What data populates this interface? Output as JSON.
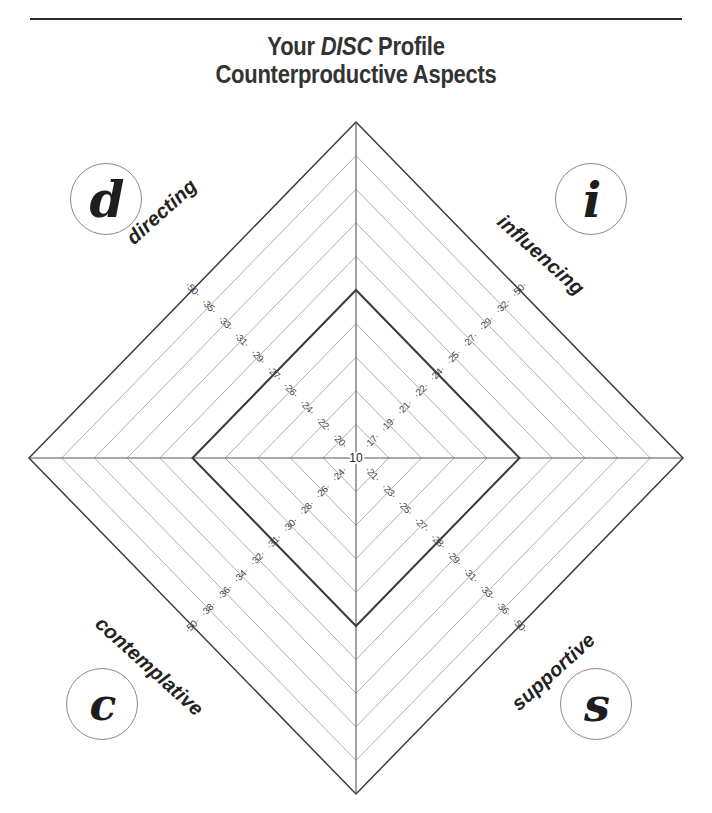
{
  "page": {
    "background": "#ffffff",
    "rule_color": "#2b2b2b"
  },
  "title": {
    "line1_prefix": "Your ",
    "line1_emphasis": "DISC",
    "line1_suffix": " Profile",
    "line2": "Counterproductive Aspects",
    "color": "#333333"
  },
  "badges": [
    {
      "key": "d",
      "glyph": "d",
      "name": "badge-d-directing"
    },
    {
      "key": "i",
      "glyph": "i",
      "name": "badge-i-influencing"
    },
    {
      "key": "c",
      "glyph": "c",
      "name": "badge-c-contemplative"
    },
    {
      "key": "s",
      "glyph": "s",
      "name": "badge-s-supportive"
    }
  ],
  "axis_names": {
    "directing": "directing",
    "influencing": "influencing",
    "contemplative": "contemplative",
    "supportive": "supportive"
  },
  "center": {
    "label": "10"
  },
  "chart_data": {
    "type": "radar",
    "subtitle": "Counterproductive Aspects",
    "center_value": 10,
    "grid": true,
    "grid_rings": 10,
    "legend": "none",
    "axes": [
      "directing",
      "influencing",
      "supportive",
      "contemplative"
    ],
    "axis_angles_deg": [
      135,
      45,
      315,
      225
    ],
    "categories": [
      "directing",
      "influencing",
      "supportive",
      "contemplative"
    ],
    "tick_labels": {
      "directing": [
        "20",
        "22",
        "24",
        "26",
        "27",
        "29",
        "31",
        "33",
        "35",
        "50"
      ],
      "influencing": [
        "17",
        "19",
        "21",
        "22",
        "24",
        "25",
        "27",
        "29",
        "32",
        "50"
      ],
      "supportive": [
        "21",
        "23",
        "25",
        "27",
        "28",
        "29",
        "31",
        "33",
        "36",
        "50"
      ],
      "contemplative": [
        "24",
        "26",
        "28",
        "30",
        "31",
        "32",
        "34",
        "36",
        "38",
        "50"
      ]
    },
    "series": [
      {
        "name": "profile",
        "color": "#3a3a3a",
        "ring_index": 5,
        "values": {
          "directing": 29,
          "influencing": 25,
          "supportive": 29,
          "contemplative": 32
        }
      }
    ],
    "ylim": [
      10,
      50
    ],
    "xlabel": "",
    "ylabel": ""
  },
  "geometry": {
    "cx": 356,
    "cy": 458,
    "rx": 327,
    "ry": 336,
    "rings": 10,
    "data_ring": 5,
    "grid_color": "#9a9a9a",
    "outer_color": "#3d3d3d",
    "axis_color": "#555555",
    "data_color": "#3a3a3a"
  }
}
